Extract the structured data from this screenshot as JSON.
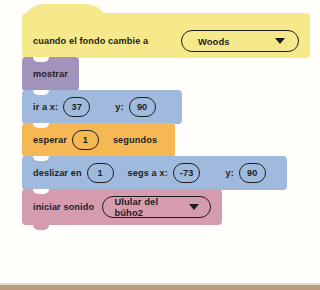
{
  "app": {
    "title": "Scratch block script",
    "language": "es"
  },
  "colors": {
    "hat_yellow": "#f6e98c",
    "looks_purple": "#a293bd",
    "motion_blue": "#9fbadc",
    "control_orange": "#f6b755",
    "sound_pink": "#d59cae",
    "outline_black": "#1d1d1f",
    "canvas_white": "#fffefb",
    "page_edge_tan": "#b89a7c"
  },
  "script": {
    "blocks": [
      {
        "id": "when-backdrop-switches",
        "category": "events",
        "label": "cuando el fondo cambie a",
        "dropdown": {
          "value": "Woods",
          "icon": "chevron-down-icon"
        }
      },
      {
        "id": "show",
        "category": "looks",
        "label": "mostrar"
      },
      {
        "id": "go-to-xy",
        "category": "motion",
        "label": "ir a x:",
        "x_value": "37",
        "y_label": "y:",
        "y_value": "90"
      },
      {
        "id": "wait-seconds",
        "category": "control",
        "label": "esperar",
        "value": "1",
        "suffix": "segundos"
      },
      {
        "id": "glide-secs-to-xy",
        "category": "motion",
        "label": "deslizar en",
        "secs_value": "1",
        "mid_label": "segs a x:",
        "x_value": "-73",
        "y_label": "y:",
        "y_value": "90"
      },
      {
        "id": "start-sound",
        "category": "sound",
        "label": "iniciar sonido",
        "dropdown": {
          "value": "Ulular del búho2",
          "icon": "chevron-down-icon"
        }
      }
    ]
  }
}
